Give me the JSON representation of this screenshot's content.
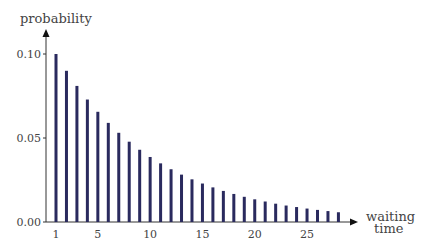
{
  "chart_data": {
    "type": "bar",
    "title": "",
    "xlabel": "waiting time",
    "ylabel": "probability",
    "x": [
      1,
      2,
      3,
      4,
      5,
      6,
      7,
      8,
      9,
      10,
      11,
      12,
      13,
      14,
      15,
      16,
      17,
      18,
      19,
      20,
      21,
      22,
      23,
      24,
      25,
      26,
      27,
      28
    ],
    "values": [
      0.1,
      0.09,
      0.081,
      0.0729,
      0.0656,
      0.059,
      0.0531,
      0.0478,
      0.043,
      0.0387,
      0.0349,
      0.0314,
      0.0282,
      0.0254,
      0.0229,
      0.0206,
      0.0185,
      0.0167,
      0.015,
      0.0135,
      0.0122,
      0.0109,
      0.0098,
      0.0089,
      0.008,
      0.0072,
      0.0065,
      0.0058
    ],
    "xticks": [
      "1",
      "5",
      "10",
      "15",
      "20",
      "25"
    ],
    "yticks": [
      "0.00",
      "0.05",
      "0.10"
    ],
    "ylim": [
      0,
      0.11
    ],
    "grid": false,
    "bar_color": "#2a2a5e"
  },
  "labels": {
    "ylabel": "probability",
    "xlabel_line1": "waiting",
    "xlabel_line2": "time"
  }
}
